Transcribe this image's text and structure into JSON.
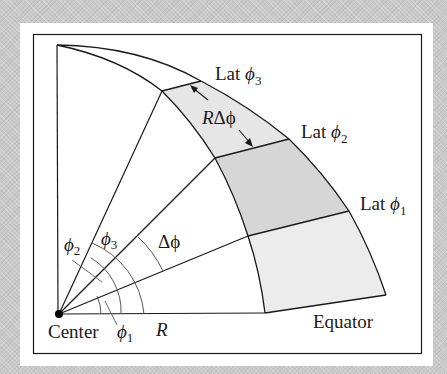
{
  "figure": {
    "colors": {
      "background": "#c9c9c9",
      "panel": "#ffffff",
      "stroke": "#1a1a1a",
      "shade_light": "#e8e8e8",
      "shade_dark": "#d4d4d4"
    },
    "labels": {
      "lat3": "Lat",
      "lat3_sym": "ϕ",
      "lat3_sub": "3",
      "lat2": "Lat",
      "lat2_sym": "ϕ",
      "lat2_sub": "2",
      "lat1": "Lat",
      "lat1_sym": "ϕ",
      "lat1_sub": "1",
      "arc_length": "RΔϕ",
      "arc_length_R": "R",
      "arc_length_rest": "Δϕ",
      "delta_phi": "Δϕ",
      "phi1_sym": "ϕ",
      "phi1_sub": "1",
      "phi2_sym": "ϕ",
      "phi2_sub": "2",
      "phi3_sym": "ϕ",
      "phi3_sub": "3",
      "center": "Center",
      "radius": "R",
      "equator": "Equator"
    }
  }
}
